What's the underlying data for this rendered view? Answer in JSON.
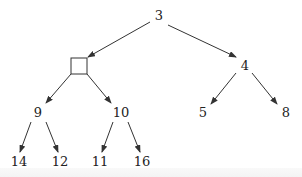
{
  "diagram": {
    "type": "binary-tree",
    "nodes": [
      {
        "id": "root",
        "label": "3",
        "x": 159,
        "y": 20
      },
      {
        "id": "empty",
        "label": "",
        "x": 79,
        "y": 66,
        "shape": "square"
      },
      {
        "id": "n4",
        "label": "4",
        "x": 245,
        "y": 70
      },
      {
        "id": "n9",
        "label": "9",
        "x": 38,
        "y": 117
      },
      {
        "id": "n10",
        "label": "10",
        "x": 121,
        "y": 117
      },
      {
        "id": "n5",
        "label": "5",
        "x": 203,
        "y": 117
      },
      {
        "id": "n8",
        "label": "8",
        "x": 286,
        "y": 117
      },
      {
        "id": "n14",
        "label": "14",
        "x": 19,
        "y": 166
      },
      {
        "id": "n12",
        "label": "12",
        "x": 60,
        "y": 166
      },
      {
        "id": "n11",
        "label": "11",
        "x": 100,
        "y": 166
      },
      {
        "id": "n16",
        "label": "16",
        "x": 142,
        "y": 166
      }
    ],
    "edges": [
      {
        "from": "root",
        "to": "empty",
        "x1": 150,
        "y1": 22,
        "x2": 88,
        "y2": 57
      },
      {
        "from": "root",
        "to": "n4",
        "x1": 168,
        "y1": 25,
        "x2": 236,
        "y2": 57
      },
      {
        "from": "empty",
        "to": "n9",
        "x1": 71,
        "y1": 74,
        "x2": 46,
        "y2": 103
      },
      {
        "from": "empty",
        "to": "n10",
        "x1": 87,
        "y1": 74,
        "x2": 111,
        "y2": 103
      },
      {
        "from": "n4",
        "to": "n5",
        "x1": 236,
        "y1": 73,
        "x2": 211,
        "y2": 104
      },
      {
        "from": "n4",
        "to": "n8",
        "x1": 252,
        "y1": 73,
        "x2": 277,
        "y2": 104
      },
      {
        "from": "n9",
        "to": "n14",
        "x1": 31,
        "y1": 122,
        "x2": 20,
        "y2": 152
      },
      {
        "from": "n9",
        "to": "n12",
        "x1": 46,
        "y1": 122,
        "x2": 58,
        "y2": 152
      },
      {
        "from": "n10",
        "to": "n11",
        "x1": 113,
        "y1": 122,
        "x2": 102,
        "y2": 152
      },
      {
        "from": "n10",
        "to": "n16",
        "x1": 128,
        "y1": 122,
        "x2": 140,
        "y2": 152
      }
    ]
  }
}
